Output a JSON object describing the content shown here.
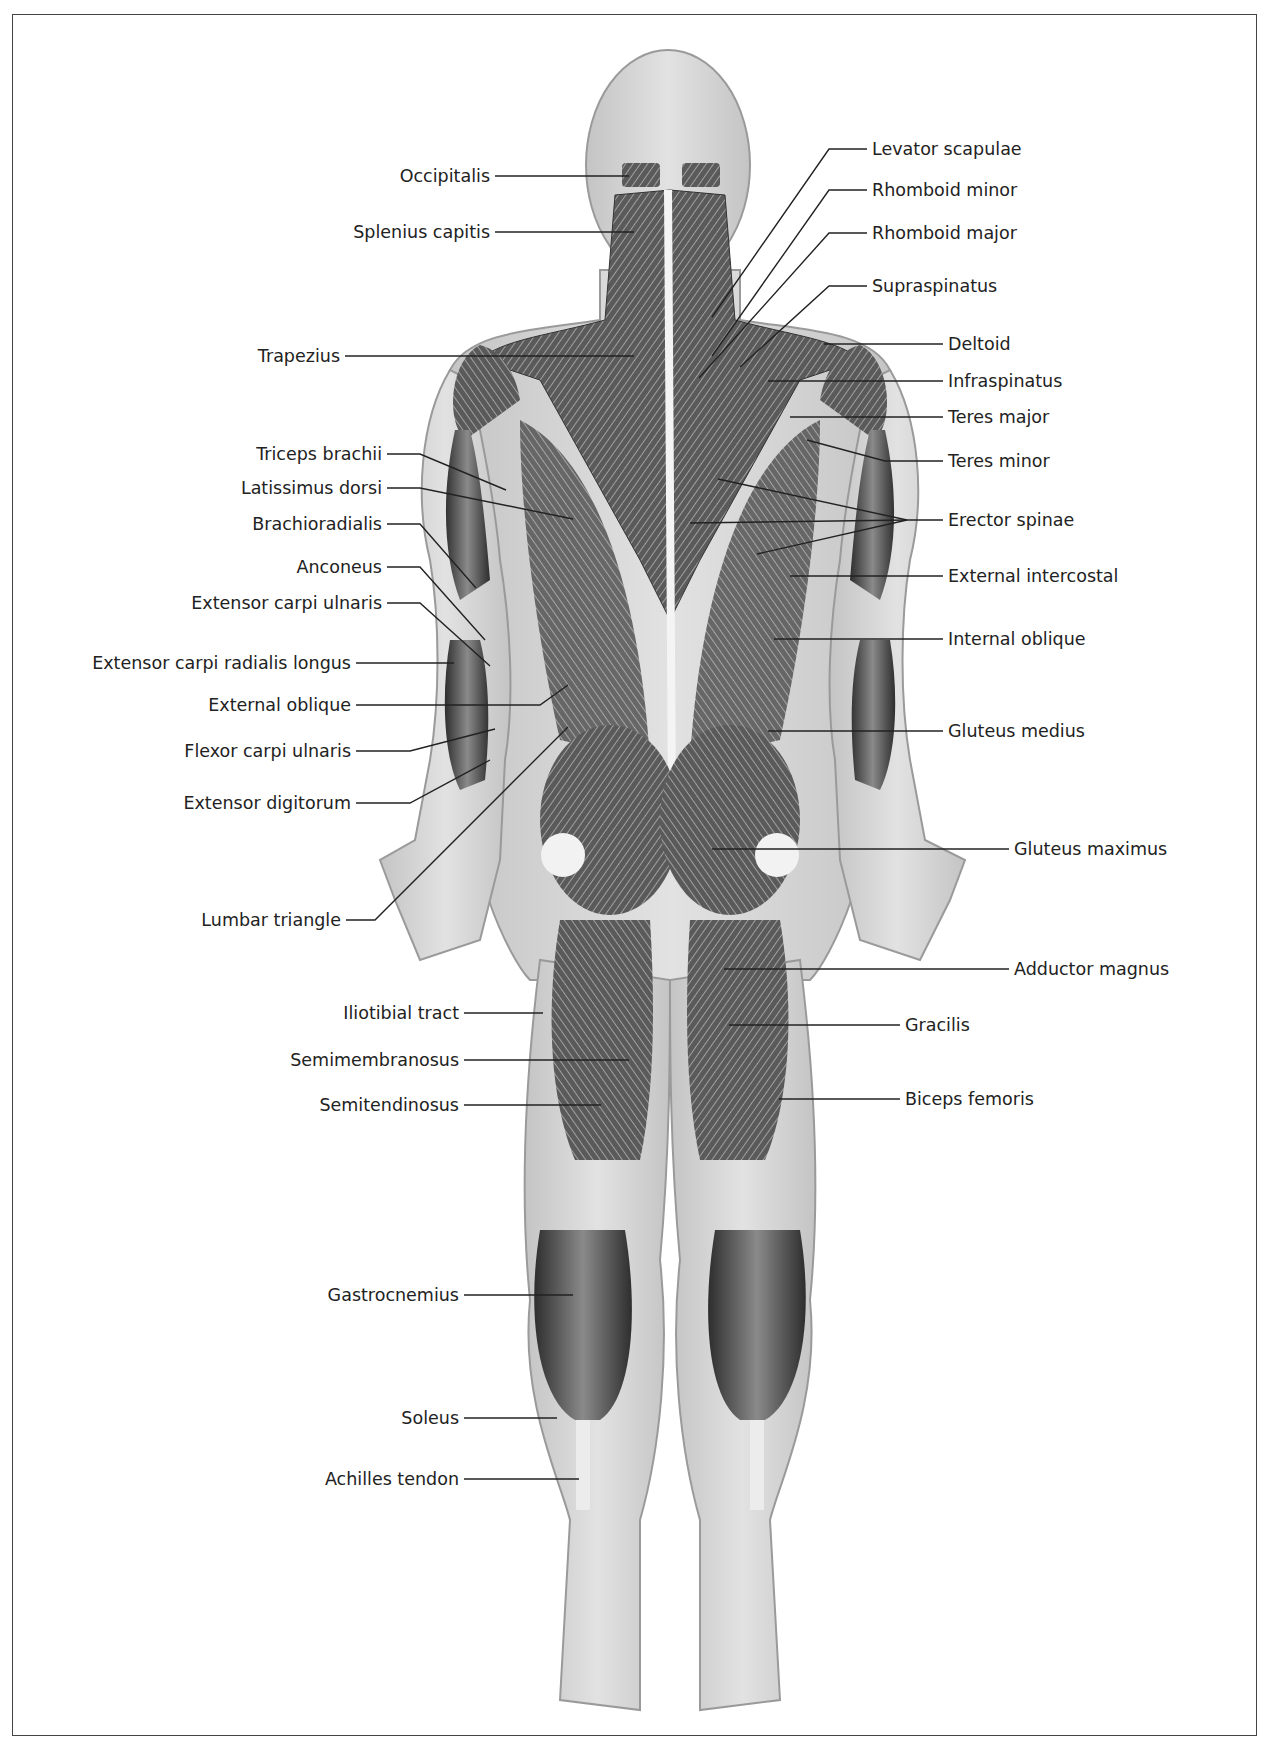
{
  "figure": {
    "view": "posterior",
    "colors": {
      "skin": "#d6d6d6",
      "skin_edge": "#9a9a9a",
      "muscle_dark": "#3a3a3a",
      "muscle_mid": "#6e6e6e",
      "tendon": "#efefef",
      "leader": "#222222",
      "border": "#444444"
    }
  },
  "labels_left": [
    {
      "text": "Occipitalis",
      "x": 490,
      "y": 176
    },
    {
      "text": "Splenius capitis",
      "x": 490,
      "y": 232
    },
    {
      "text": "Trapezius",
      "x": 340,
      "y": 356
    },
    {
      "text": "Triceps brachii",
      "x": 382,
      "y": 454
    },
    {
      "text": "Latissimus dorsi",
      "x": 382,
      "y": 488
    },
    {
      "text": "Brachioradialis",
      "x": 382,
      "y": 524
    },
    {
      "text": "Anconeus",
      "x": 382,
      "y": 567
    },
    {
      "text": "Extensor carpi ulnaris",
      "x": 382,
      "y": 603
    },
    {
      "text": "Extensor carpi radialis longus",
      "x": 351,
      "y": 663
    },
    {
      "text": "External oblique",
      "x": 351,
      "y": 705
    },
    {
      "text": "Flexor carpi ulnaris",
      "x": 351,
      "y": 751
    },
    {
      "text": "Extensor digitorum",
      "x": 351,
      "y": 803
    },
    {
      "text": "Lumbar triangle",
      "x": 341,
      "y": 920
    },
    {
      "text": "Iliotibial tract",
      "x": 459,
      "y": 1013
    },
    {
      "text": "Semimembranosus",
      "x": 459,
      "y": 1060
    },
    {
      "text": "Semitendinosus",
      "x": 459,
      "y": 1105
    },
    {
      "text": "Gastrocnemius",
      "x": 459,
      "y": 1295
    },
    {
      "text": "Soleus",
      "x": 459,
      "y": 1418
    },
    {
      "text": "Achilles tendon",
      "x": 459,
      "y": 1479
    }
  ],
  "labels_right": [
    {
      "text": "Levator scapulae",
      "x": 872,
      "y": 149
    },
    {
      "text": "Rhomboid minor",
      "x": 872,
      "y": 190
    },
    {
      "text": "Rhomboid major",
      "x": 872,
      "y": 233
    },
    {
      "text": "Supraspinatus",
      "x": 872,
      "y": 286
    },
    {
      "text": "Deltoid",
      "x": 948,
      "y": 344
    },
    {
      "text": "Infraspinatus",
      "x": 948,
      "y": 381
    },
    {
      "text": "Teres major",
      "x": 948,
      "y": 417
    },
    {
      "text": "Teres minor",
      "x": 948,
      "y": 461
    },
    {
      "text": "Erector spinae",
      "x": 948,
      "y": 520
    },
    {
      "text": "External intercostal",
      "x": 948,
      "y": 576
    },
    {
      "text": "Internal oblique",
      "x": 948,
      "y": 639
    },
    {
      "text": "Gluteus medius",
      "x": 948,
      "y": 731
    },
    {
      "text": "Gluteus maximus",
      "x": 1014,
      "y": 849
    },
    {
      "text": "Adductor magnus",
      "x": 1014,
      "y": 969
    },
    {
      "text": "Gracilis",
      "x": 905,
      "y": 1025
    },
    {
      "text": "Biceps femoris",
      "x": 905,
      "y": 1099
    }
  ],
  "leaders": [
    "M495,176 L629,176",
    "M495,232 L634,232",
    "M345,356 L634,356",
    "M387,454 L420,454 L506,490",
    "M387,488 L420,488 L573,519",
    "M387,524 L420,524 L476,588",
    "M387,567 L420,567 L485,640",
    "M387,603 L420,603 L490,666",
    "M356,663 L454,663",
    "M356,705 L540,705 L568,685",
    "M356,751 L410,751 L495,729",
    "M356,803 L410,803 L490,760",
    "M346,920 L375,920 L568,727",
    "M464,1013 L543,1013",
    "M464,1060 L629,1060",
    "M464,1105 L601,1105",
    "M464,1295 L573,1295",
    "M464,1418 L557,1418",
    "M464,1479 L579,1479",
    "M867,149 L829,149 L712,317",
    "M867,190 L829,190 L712,356",
    "M867,233 L829,233 L699,378",
    "M867,286 L829,286 L740,367",
    "M943,344 L824,344",
    "M943,381 L768,381",
    "M943,417 L790,417",
    "M943,461 L885,461 L807,440",
    "M943,520 L907,520 L718,479",
    "M907,520 L690,523",
    "M907,520 L757,554",
    "M943,576 L790,576",
    "M943,639 L774,639",
    "M943,731 L768,731",
    "M1009,849 L712,849",
    "M1009,969 L724,969",
    "M900,1025 L729,1025",
    "M900,1099 L779,1099"
  ]
}
